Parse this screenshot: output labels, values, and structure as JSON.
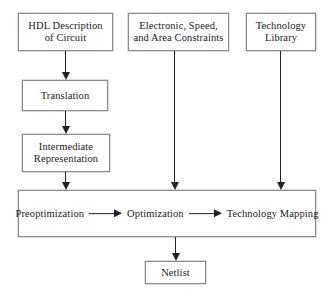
{
  "diagram": {
    "nodes": {
      "hdl": "HDL Description\nof  Circuit",
      "constraints": "Electronic, Speed,\nand Area Constraints",
      "technology_library": "Technology\nLibrary",
      "translation": "Translation",
      "intermediate": "Intermediate\nRepresentation",
      "netlist": "Netlist"
    },
    "pipeline": {
      "stages": [
        {
          "label": "Preoptimization"
        },
        {
          "label": "Optimization"
        },
        {
          "label": "Technology Mapping"
        }
      ],
      "arrow_glyph": "right-arrow"
    },
    "colors": {
      "background": "#ffffff",
      "box_border": "#8a8a8a",
      "arrow": "#222222",
      "text": "#1a1a1a"
    }
  }
}
